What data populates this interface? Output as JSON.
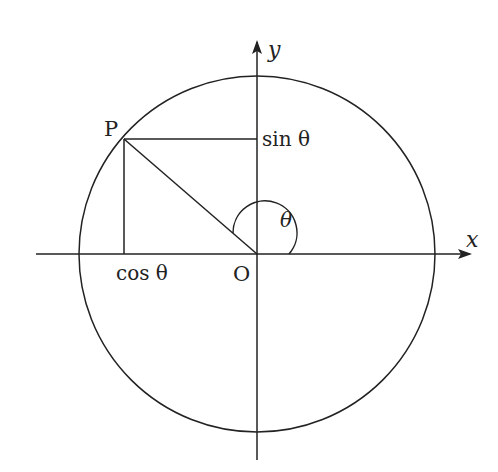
{
  "diagram": {
    "labels": {
      "x_axis": "x",
      "y_axis": "y",
      "point": "P",
      "origin": "O",
      "sin": "sin θ",
      "cos": "cos θ",
      "angle": "θ"
    },
    "colors": {
      "stroke": "#222222",
      "background": "#ffffff"
    }
  }
}
